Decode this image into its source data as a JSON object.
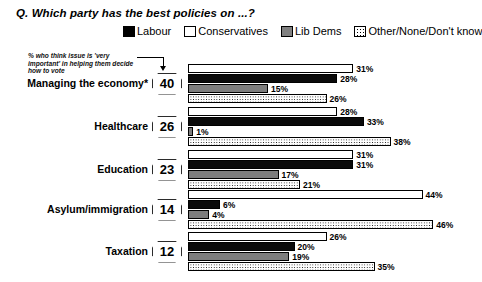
{
  "title": "Q. Which party has the best policies on ...?",
  "annotation": "% who think issue is 'very important' in helping them decide how to vote",
  "legend": {
    "items": [
      {
        "label": "Labour",
        "swatch": "solid-black-swatch",
        "color": "#000000"
      },
      {
        "label": "Conservatives",
        "swatch": "outlined-white-swatch",
        "color": "#ffffff"
      },
      {
        "label": "Lib Dems",
        "swatch": "solid-gray-swatch",
        "color": "#808080"
      },
      {
        "label": "Other/None/Don't know",
        "swatch": "dotted-pattern-swatch",
        "color": "#ffffff"
      }
    ]
  },
  "rows": [
    {
      "category": "Managing the economy*",
      "importance": "40",
      "bars": [
        {
          "party": "Conservatives",
          "value": 31,
          "label": "31%"
        },
        {
          "party": "Labour",
          "value": 28,
          "label": "28%"
        },
        {
          "party": "Lib Dems",
          "value": 15,
          "label": "15%"
        },
        {
          "party": "Other/None/Don't know",
          "value": 26,
          "label": "26%"
        }
      ]
    },
    {
      "category": "Healthcare",
      "importance": "26",
      "bars": [
        {
          "party": "Conservatives",
          "value": 28,
          "label": "28%"
        },
        {
          "party": "Labour",
          "value": 33,
          "label": "33%"
        },
        {
          "party": "Lib Dems",
          "value": 1,
          "label": "1%"
        },
        {
          "party": "Other/None/Don't know",
          "value": 38,
          "label": "38%"
        }
      ]
    },
    {
      "category": "Education",
      "importance": "23",
      "bars": [
        {
          "party": "Conservatives",
          "value": 31,
          "label": "31%"
        },
        {
          "party": "Labour",
          "value": 31,
          "label": "31%"
        },
        {
          "party": "Lib Dems",
          "value": 17,
          "label": "17%"
        },
        {
          "party": "Other/None/Don't know",
          "value": 21,
          "label": "21%"
        }
      ]
    },
    {
      "category": "Asylum/immigration",
      "importance": "14",
      "bars": [
        {
          "party": "Conservatives",
          "value": 44,
          "label": "44%"
        },
        {
          "party": "Labour",
          "value": 6,
          "label": "6%"
        },
        {
          "party": "Lib Dems",
          "value": 4,
          "label": "4%"
        },
        {
          "party": "Other/None/Don't know",
          "value": 46,
          "label": "46%"
        }
      ]
    },
    {
      "category": "Taxation",
      "importance": "12",
      "bars": [
        {
          "party": "Conservatives",
          "value": 26,
          "label": "26%"
        },
        {
          "party": "Labour",
          "value": 20,
          "label": "20%"
        },
        {
          "party": "Lib Dems",
          "value": 19,
          "label": "19%"
        },
        {
          "party": "Other/None/Don't know",
          "value": 35,
          "label": "35%"
        }
      ]
    }
  ],
  "chart_data": {
    "type": "bar",
    "orientation": "horizontal",
    "title": "Q. Which party has the best policies on ...?",
    "xlabel": "",
    "ylabel": "",
    "xlim": [
      0,
      46
    ],
    "grid": false,
    "legend_position": "top",
    "annotations": [
      {
        "text": "% who think issue is 'very important' in helping them decide how to vote",
        "target": "importance-badges",
        "style": "arrow-pointing-down-to-badge"
      },
      {
        "text": "*",
        "target": "Managing the economy",
        "style": "asterisk-footnote-marker"
      }
    ],
    "categories": [
      "Managing the economy*",
      "Healthcare",
      "Education",
      "Asylum/immigration",
      "Taxation"
    ],
    "importance_scores": [
      40,
      26,
      23,
      14,
      12
    ],
    "bar_order_top_to_bottom": [
      "Conservatives",
      "Labour",
      "Lib Dems",
      "Other/None/Don't know"
    ],
    "series": [
      {
        "name": "Conservatives",
        "fill": "white",
        "values": [
          31,
          28,
          31,
          44,
          26
        ]
      },
      {
        "name": "Labour",
        "fill": "black",
        "values": [
          28,
          33,
          31,
          6,
          20
        ]
      },
      {
        "name": "Lib Dems",
        "fill": "gray",
        "values": [
          15,
          1,
          17,
          4,
          19
        ]
      },
      {
        "name": "Other/None/Don't know",
        "fill": "dotted",
        "values": [
          26,
          38,
          21,
          46,
          35
        ]
      }
    ],
    "units": "percent"
  }
}
